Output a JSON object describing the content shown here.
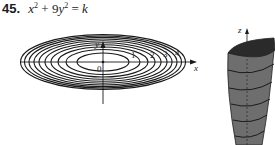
{
  "problem": {
    "number": "45.",
    "equation_parts": {
      "x": "x",
      "x_exp": "2",
      "plus": " + 9",
      "y": "y",
      "y_exp": "2",
      "equals": " = ",
      "k": "k"
    }
  },
  "contour_plot": {
    "x_axis_label": "x",
    "y_axis_label": "y",
    "origin_label": "0",
    "level_labels": [
      "1",
      "2",
      "3",
      "4"
    ]
  },
  "surface_plot": {
    "z_axis_label": "z"
  },
  "colors": {
    "ink": "#1a1a1a",
    "surface_fill": "#6b6b6b",
    "surface_top": "#2a2a2a"
  }
}
